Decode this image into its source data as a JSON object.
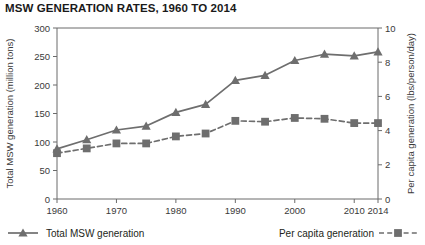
{
  "title": "MSW GENERATION RATES, 1960 TO 2014",
  "colors": {
    "series": "#6e6e6e",
    "axis": "#6b6b6b",
    "text": "#231f20"
  },
  "legend": {
    "position": "below-plot",
    "entries": [
      {
        "label": "Total MSW generation",
        "marker": "triangle",
        "line": "solid"
      },
      {
        "label": "Per capita generation",
        "marker": "square",
        "line": "dashed"
      }
    ]
  },
  "chart_data": {
    "type": "line",
    "title": "MSW GENERATION RATES, 1960 TO 2014",
    "xlabel": "",
    "x": [
      1960,
      1965,
      1970,
      1975,
      1980,
      1985,
      1990,
      1995,
      2000,
      2005,
      2010,
      2014
    ],
    "xticklabels": [
      "1960",
      "1970",
      "1980",
      "1990",
      "2000",
      "2010",
      "2014"
    ],
    "xticks": [
      1960,
      1970,
      1980,
      1990,
      2000,
      2010,
      2014
    ],
    "xlim": [
      1960,
      2014
    ],
    "grid": false,
    "series": [
      {
        "name": "Total MSW generation",
        "axis": "left",
        "ylabel": "Total MSW generation (million tons)",
        "unit": "million tons",
        "ylim": [
          0,
          300
        ],
        "yticks": [
          0,
          50,
          100,
          150,
          200,
          250,
          300
        ],
        "line": "solid",
        "marker": "triangle",
        "values": [
          88,
          104,
          121,
          128,
          152,
          166,
          208,
          217,
          243,
          254,
          251,
          258
        ]
      },
      {
        "name": "Per capita generation",
        "axis": "right",
        "ylabel": "Per capita generation (lbs/person/day)",
        "unit": "lbs/person/day",
        "ylim": [
          0,
          10
        ],
        "yticks": [
          0,
          2,
          4,
          6,
          8,
          10
        ],
        "line": "dashed",
        "marker": "square",
        "values": [
          2.68,
          2.96,
          3.25,
          3.25,
          3.66,
          3.83,
          4.57,
          4.52,
          4.74,
          4.69,
          4.44,
          4.44
        ]
      }
    ]
  }
}
